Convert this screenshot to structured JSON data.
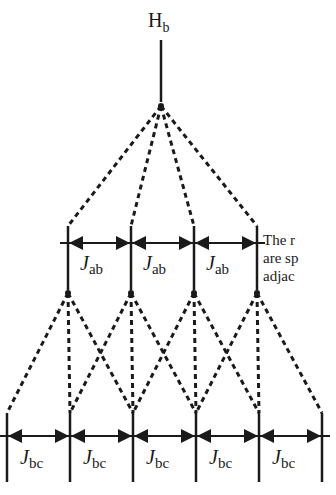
{
  "diagram": {
    "type": "nmr-splitting-tree",
    "top_label": {
      "main": "H",
      "sub": "b"
    },
    "level1": {
      "coupling_labels": [
        {
          "main": "J",
          "sub": "ab"
        },
        {
          "main": "J",
          "sub": "ab"
        },
        {
          "main": "J",
          "sub": "ab"
        }
      ],
      "line_count": 4
    },
    "level2": {
      "coupling_labels": [
        {
          "main": "J",
          "sub": "bc"
        },
        {
          "main": "J",
          "sub": "bc"
        },
        {
          "main": "J",
          "sub": "bc"
        },
        {
          "main": "J",
          "sub": "bc"
        },
        {
          "main": "J",
          "sub": "bc"
        }
      ],
      "line_count": 6
    },
    "side_text_lines": [
      "The r",
      "are sp",
      "adjac"
    ],
    "colors": {
      "ink": "#1a1a1a",
      "background": "#ffffff"
    }
  }
}
